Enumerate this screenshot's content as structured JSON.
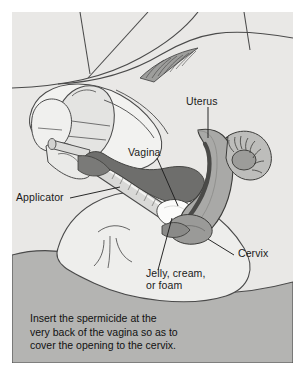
{
  "figure": {
    "background_color": "#ffffff",
    "illustration_background": "#e9e8e6",
    "lower_band_color": "#b4b4b2",
    "line_color": "#4a4a4a",
    "uterus_fill": "#a9a9a7",
    "vagina_fill": "#6e6e6c",
    "spermicide_fill": "#fbfbfa",
    "applicator_fill": "#d8d8d6"
  },
  "labels": {
    "uterus": "Uterus",
    "vagina": "Vagina",
    "applicator": "Applicator",
    "cervix": "Cervix",
    "jelly_line1": "Jelly, cream,",
    "jelly_line2": "or foam"
  },
  "caption": {
    "line1": "Insert the spermicide at the",
    "line2": "very back of the vagina so as to",
    "line3": "cover the opening to the cervix."
  }
}
